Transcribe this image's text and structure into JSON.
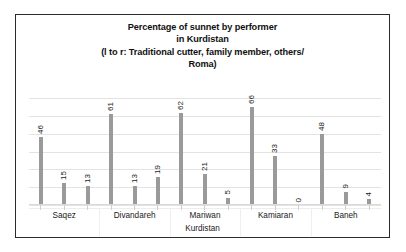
{
  "chart_data": {
    "type": "bar",
    "title": "Percentage of sunnet by performer in Kurdistan (l to r: Traditional cutter, family member, others/ Roma)",
    "title_lines": [
      "Percentage of sunnet by performer",
      "in Kurdistan",
      "(l to r: Traditional cutter, family member, others/",
      "Roma)"
    ],
    "xlabel": "Kurdistan",
    "ylabel": "",
    "categories": [
      "Saqez",
      "Divandareh",
      "Mariwan",
      "Kamiaran",
      "Baneh"
    ],
    "series": [
      {
        "name": "Traditional cutter",
        "values": [
          46,
          61,
          62,
          66,
          48
        ]
      },
      {
        "name": "family member",
        "values": [
          15,
          13,
          21,
          33,
          9
        ]
      },
      {
        "name": "others/ Roma",
        "values": [
          13,
          19,
          5,
          0,
          4
        ]
      }
    ],
    "bars": [
      {
        "group": "Saqez",
        "series": "Traditional cutter",
        "value": 46
      },
      {
        "group": "Saqez",
        "series": "family member",
        "value": 15
      },
      {
        "group": "Saqez",
        "series": "others/ Roma",
        "value": 13
      },
      {
        "group": "Divandareh",
        "series": "Traditional cutter",
        "value": 61
      },
      {
        "group": "Divandareh",
        "series": "family member",
        "value": 13
      },
      {
        "group": "Divandareh",
        "series": "others/ Roma",
        "value": 19
      },
      {
        "group": "Mariwan",
        "series": "Traditional cutter",
        "value": 62
      },
      {
        "group": "Mariwan",
        "series": "family member",
        "value": 21
      },
      {
        "group": "Mariwan",
        "series": "others/ Roma",
        "value": 5
      },
      {
        "group": "Kamiaran",
        "series": "Traditional cutter",
        "value": 66
      },
      {
        "group": "Kamiaran",
        "series": "family member",
        "value": 33
      },
      {
        "group": "Kamiaran",
        "series": "others/ Roma",
        "value": 0
      },
      {
        "group": "Baneh",
        "series": "Traditional cutter",
        "value": 48
      },
      {
        "group": "Baneh",
        "series": "family member",
        "value": 9
      },
      {
        "group": "Baneh",
        "series": "others/ Roma",
        "value": 4
      }
    ],
    "value_labels": [
      "46",
      "15",
      "13",
      "61",
      "13",
      "19",
      "62",
      "21",
      "5",
      "66",
      "33",
      "0",
      "48",
      "9",
      "4"
    ],
    "ylim": [
      0,
      70
    ],
    "gridlines": 7,
    "grid": true,
    "legend": "none",
    "bar_color": "#9a9a9a",
    "grid_color": "#e3e3e3",
    "border_color": "#2b2b2b",
    "background": "#ffffff"
  }
}
